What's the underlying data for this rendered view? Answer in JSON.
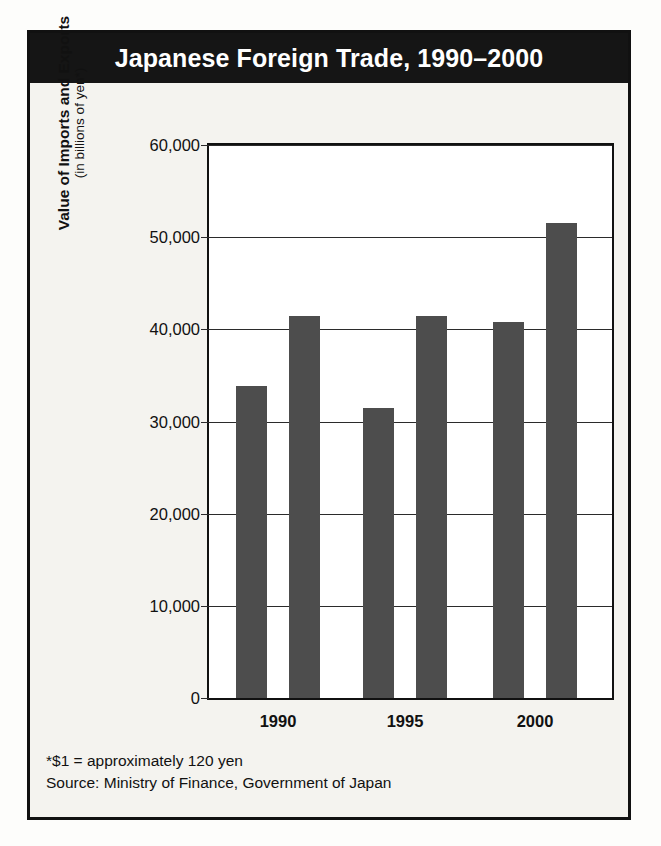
{
  "figure": {
    "title": "Japanese Foreign Trade, 1990–2000",
    "footnotes": [
      "*$1 = approximately 120 yen",
      "Source: Ministry of Finance, Government of Japan"
    ],
    "colors": {
      "title_bar": "#151515",
      "bar_fill": "#4d4d4d",
      "frame": "#111111",
      "plot_background": "#ffffff",
      "figure_background": "#f4f3ef"
    }
  },
  "chart_data": {
    "type": "bar",
    "title": "Japanese Foreign Trade, 1990–2000",
    "subtitle": "",
    "xlabel": "",
    "ylabel": "Value of Imports and Exports",
    "ylabel_line2": "(in billions of yen*)",
    "categories": [
      "1990",
      "1995",
      "2000"
    ],
    "series": [
      {
        "name": "Imports",
        "values": [
          33900,
          31500,
          40800
        ]
      },
      {
        "name": "Exports",
        "values": [
          41500,
          41500,
          51500
        ]
      }
    ],
    "ylim": [
      0,
      60000
    ],
    "ytick_values": [
      0,
      10000,
      20000,
      30000,
      40000,
      50000,
      60000
    ],
    "ytick_labels": [
      "0",
      "10,000",
      "20,000",
      "30,000",
      "40,000",
      "50,000",
      "60,000"
    ],
    "grid": true,
    "grid_axis": "y",
    "legend": "none",
    "bar_color": "#4d4d4d",
    "notes": [
      "*$1 = approximately 120 yen",
      "Source: Ministry of Finance, Government of Japan"
    ]
  }
}
